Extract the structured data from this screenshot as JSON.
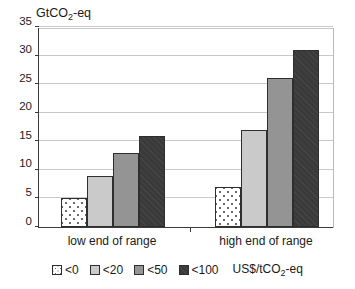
{
  "chart_data": {
    "type": "bar",
    "title": "GtCO2-eq",
    "title_prefix": "GtCO",
    "title_sub": "2",
    "title_suffix": "-eq",
    "xlabel": "",
    "ylabel": "GtCO2-eq",
    "ylim": [
      0,
      35
    ],
    "yticks": [
      0,
      5,
      10,
      15,
      20,
      25,
      30,
      35
    ],
    "grid": true,
    "legend_position": "bottom",
    "categories": [
      "low end of range",
      "high end of range"
    ],
    "series": [
      {
        "name": "<0",
        "values": [
          5,
          7
        ],
        "color": "#ffffff",
        "pattern": "dotted"
      },
      {
        "name": "<20",
        "values": [
          9,
          17
        ],
        "color": "#cacaca",
        "pattern": "solid"
      },
      {
        "name": "<50",
        "values": [
          13,
          26
        ],
        "color": "#949494",
        "pattern": "solid"
      },
      {
        "name": "<100",
        "values": [
          16,
          31
        ],
        "color": "#3a3a3a",
        "pattern": "hatched"
      }
    ],
    "legend_unit_prefix": "US$/tCO",
    "legend_unit_sub": "2",
    "legend_unit_suffix": "-eq"
  }
}
